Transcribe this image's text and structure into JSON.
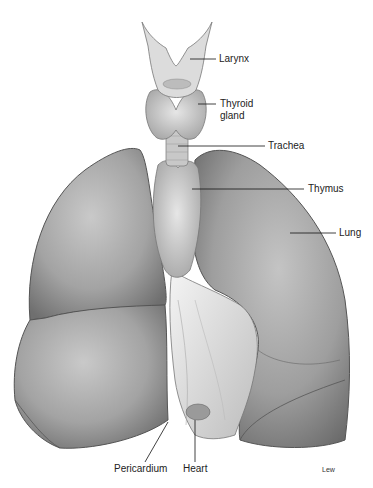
{
  "figure": {
    "colors": {
      "background": "#ffffff",
      "tissue_light": "#d8d8d8",
      "tissue_mid": "#a9a9a9",
      "tissue_dark": "#6e6e6e",
      "line": "#111111"
    }
  },
  "labels": {
    "larynx": "Larynx",
    "thyroid_line1": "Thyroid",
    "thyroid_line2": "gland",
    "trachea": "Trachea",
    "thymus": "Thymus",
    "lung": "Lung",
    "pericardium": "Pericardium",
    "heart": "Heart"
  },
  "credit": "Lew"
}
